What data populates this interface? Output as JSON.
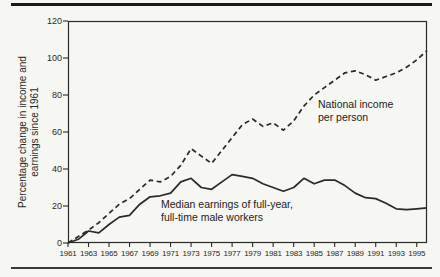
{
  "chart_data": {
    "type": "line",
    "title": "",
    "ylabel": [
      "Percentage change in income and",
      "earnings since 1961"
    ],
    "xlabel": "",
    "xlim": [
      1961,
      1996
    ],
    "ylim": [
      0,
      120
    ],
    "grid": false,
    "legend_position": "inline-annotations",
    "yticks": [
      0,
      20,
      40,
      60,
      80,
      100,
      120
    ],
    "xticks": [
      1961,
      1963,
      1965,
      1967,
      1969,
      1971,
      1973,
      1975,
      1977,
      1979,
      1981,
      1983,
      1985,
      1987,
      1989,
      1991,
      1993,
      1995
    ],
    "x": [
      1961,
      1962,
      1963,
      1964,
      1965,
      1966,
      1967,
      1968,
      1969,
      1970,
      1971,
      1972,
      1973,
      1974,
      1975,
      1976,
      1977,
      1978,
      1979,
      1980,
      1981,
      1982,
      1983,
      1984,
      1985,
      1986,
      1987,
      1988,
      1989,
      1990,
      1991,
      1992,
      1993,
      1994,
      1995,
      1996
    ],
    "series": [
      {
        "name": "National income per person",
        "line_style": "dashed",
        "values": [
          0,
          3.5,
          7,
          11,
          16,
          21,
          24,
          29,
          34,
          33,
          36,
          42,
          51,
          47,
          43,
          50,
          57,
          64,
          67,
          63,
          65,
          61,
          66,
          74,
          80,
          84,
          88,
          92,
          93,
          91,
          88,
          90,
          92,
          95,
          99,
          104
        ]
      },
      {
        "name": "Median earnings of full-year, full-time male workers",
        "line_style": "solid",
        "values": [
          0,
          2,
          6.5,
          5.5,
          10,
          14,
          15,
          21,
          25,
          25.5,
          27,
          33,
          35,
          30,
          29,
          33,
          37,
          36,
          35,
          32,
          30,
          28,
          30,
          35,
          32,
          34,
          34,
          31,
          27,
          24.5,
          24,
          21.5,
          18.5,
          18,
          18.5,
          19
        ]
      }
    ],
    "annotations": [
      {
        "line1": "National income",
        "line2": "per person"
      },
      {
        "line1": "Median earnings of full-year,",
        "line2": "full-time male workers"
      }
    ],
    "ink_color": "#2a2a28",
    "paper_color": "#f6f6f2"
  }
}
